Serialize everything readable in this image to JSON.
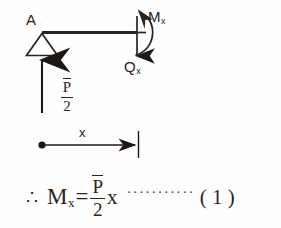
{
  "figure": {
    "type": "free-body-diagram",
    "stroke_color": "#2a2420",
    "background_color": "#fefefe"
  },
  "beam": {
    "support_point_label": "A",
    "support_type": "pin-support-triangle",
    "reaction_force": {
      "label_numerator": "P",
      "label_numerator_overbar": true,
      "label_denominator": "2",
      "direction": "up"
    },
    "cut_section": {
      "moment_label": "M",
      "moment_subscript": "x",
      "moment_direction": "counterclockwise",
      "shear_label": "Q",
      "shear_subscript": "x",
      "shear_direction": "down"
    }
  },
  "dimension": {
    "label": "x",
    "from": "A",
    "to": "cut section"
  },
  "equation": {
    "therefore": "∴",
    "lhs": "M",
    "lhs_subscript": "x",
    "equals": "=",
    "fraction_numerator": "P",
    "fraction_numerator_overbar": true,
    "fraction_denominator": "2",
    "variable": "x",
    "leader": "···········",
    "number": "( 1 )"
  }
}
